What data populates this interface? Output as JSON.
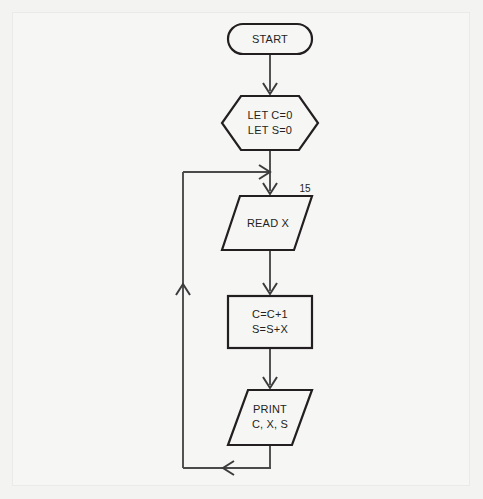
{
  "diagram": {
    "background_color": "#f3f3f2",
    "stroke_color": "#231f20",
    "line_color": "#4a4a4a",
    "nodes": [
      {
        "id": "start",
        "shape": "terminator",
        "label": "START",
        "lines": [
          "START"
        ]
      },
      {
        "id": "init",
        "shape": "hexagon",
        "label": "LET C=0 / LET S=0",
        "lines": [
          "LET C=0",
          "LET S=0"
        ]
      },
      {
        "id": "read",
        "shape": "parallelogram",
        "label": "READ X",
        "lines": [
          "READ X"
        ]
      },
      {
        "id": "process",
        "shape": "rectangle",
        "label": "C=C+1 / S=S+X",
        "lines": [
          "C=C+1",
          "S=S+X"
        ]
      },
      {
        "id": "print",
        "shape": "parallelogram",
        "label": "PRINT C, X, S",
        "lines": [
          "PRINT",
          "C, X, S"
        ]
      }
    ],
    "line_labels": [
      {
        "id": "statement-number",
        "text": "15"
      }
    ]
  }
}
